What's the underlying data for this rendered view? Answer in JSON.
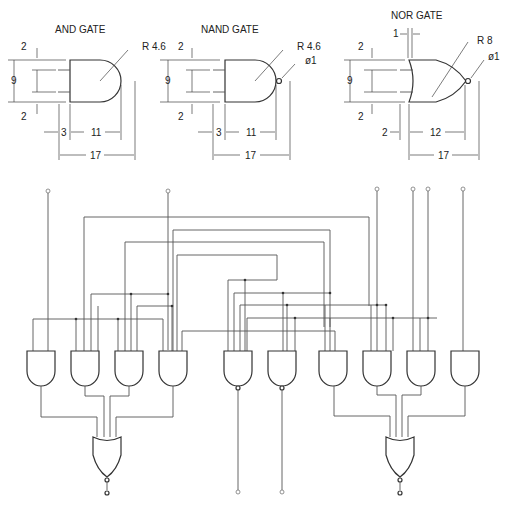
{
  "top_cutoff_text": "",
  "gates": {
    "and": {
      "title": "AND GATE",
      "dims": {
        "top": "2",
        "span": "9",
        "bottom": "2",
        "lead": "3",
        "body": "11",
        "total": "17",
        "radius": "R 4.6"
      }
    },
    "nand": {
      "title": "NAND GATE",
      "dims": {
        "top": "2",
        "span": "9",
        "bottom": "2",
        "lead": "3",
        "body": "11",
        "total": "17",
        "radius": "R 4.6",
        "bubble": "ø1"
      }
    },
    "nor": {
      "title": "NOR GATE",
      "dims": {
        "offset": "1",
        "top": "2",
        "span": "9",
        "bottom": "2",
        "lead": "2",
        "body": "12",
        "total": "17",
        "radius": "R 8",
        "bubble": "ø1"
      }
    }
  },
  "circuit": {
    "gate_row": [
      "AND",
      "AND",
      "AND",
      "AND",
      "NAND",
      "NAND",
      "AND",
      "AND",
      "AND",
      "AND"
    ],
    "output_gates": [
      "NOR",
      "NOR"
    ],
    "input_pins": 7,
    "output_pins": 4
  }
}
